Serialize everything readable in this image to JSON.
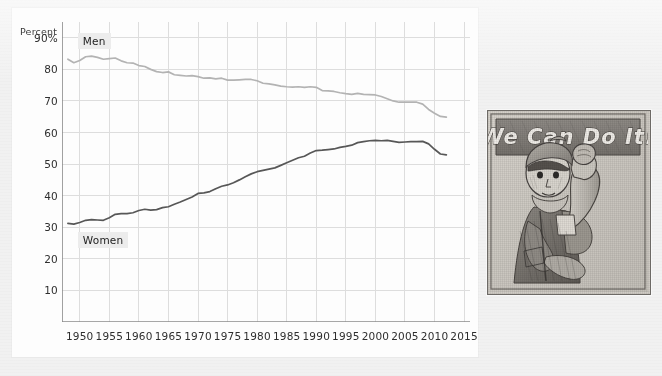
{
  "chart_data": {
    "type": "line",
    "title": "",
    "xlabel": "",
    "ylabel": "Percent",
    "ylim": [
      0,
      95
    ],
    "xlim": [
      1947,
      2016
    ],
    "grid": true,
    "legend": "inline-labels",
    "y_ticks": [
      "90%",
      "80",
      "70",
      "60",
      "50",
      "40",
      "30",
      "20",
      "10"
    ],
    "y_tick_values": [
      90,
      80,
      70,
      60,
      50,
      40,
      30,
      20,
      10
    ],
    "x_ticks": [
      "1950",
      "1955",
      "1960",
      "1965",
      "1970",
      "1975",
      "1980",
      "1985",
      "1990",
      "1995",
      "2000",
      "2005",
      "2010",
      "2015"
    ],
    "x_tick_values": [
      1950,
      1955,
      1960,
      1965,
      1970,
      1975,
      1980,
      1985,
      1990,
      1995,
      2000,
      2005,
      2010,
      2015
    ],
    "x": [
      1948,
      1949,
      1950,
      1951,
      1952,
      1953,
      1954,
      1955,
      1956,
      1957,
      1958,
      1959,
      1960,
      1961,
      1962,
      1963,
      1964,
      1965,
      1966,
      1967,
      1968,
      1969,
      1970,
      1971,
      1972,
      1973,
      1974,
      1975,
      1976,
      1977,
      1978,
      1979,
      1980,
      1981,
      1982,
      1983,
      1984,
      1985,
      1986,
      1987,
      1988,
      1989,
      1990,
      1991,
      1992,
      1993,
      1994,
      1995,
      1996,
      1997,
      1998,
      1999,
      2000,
      2001,
      2002,
      2003,
      2004,
      2005,
      2006,
      2007,
      2008,
      2009,
      2010,
      2011,
      2012
    ],
    "series": [
      {
        "name": "Men",
        "color": "#b3b3b3",
        "values": [
          83.2,
          82.1,
          82.8,
          84.0,
          84.2,
          83.8,
          83.2,
          83.4,
          83.6,
          82.7,
          82.1,
          82.0,
          81.2,
          80.9,
          80.0,
          79.3,
          79.0,
          79.2,
          78.3,
          78.1,
          77.9,
          78.0,
          77.7,
          77.2,
          77.3,
          77.0,
          77.2,
          76.6,
          76.6,
          76.7,
          76.8,
          76.8,
          76.4,
          75.6,
          75.4,
          75.1,
          74.7,
          74.5,
          74.4,
          74.5,
          74.3,
          74.5,
          74.3,
          73.3,
          73.2,
          73.0,
          72.6,
          72.3,
          72.1,
          72.4,
          72.1,
          72.0,
          71.9,
          71.4,
          70.7,
          70.0,
          69.6,
          69.6,
          69.6,
          69.6,
          69.0,
          67.3,
          66.1,
          65.1,
          64.9
        ]
      },
      {
        "name": "Women",
        "color": "#575757",
        "values": [
          31.2,
          31.0,
          31.5,
          32.2,
          32.4,
          32.3,
          32.2,
          33.0,
          34.1,
          34.3,
          34.3,
          34.6,
          35.3,
          35.7,
          35.4,
          35.6,
          36.2,
          36.5,
          37.3,
          38.0,
          38.8,
          39.6,
          40.7,
          40.9,
          41.3,
          42.2,
          43.0,
          43.4,
          44.1,
          45.0,
          46.0,
          46.9,
          47.6,
          48.0,
          48.4,
          48.8,
          49.6,
          50.4,
          51.2,
          52.0,
          52.5,
          53.5,
          54.3,
          54.4,
          54.6,
          54.8,
          55.3,
          55.6,
          56.0,
          56.8,
          57.1,
          57.4,
          57.5,
          57.4,
          57.5,
          57.2,
          56.9,
          57.0,
          57.1,
          57.1,
          57.2,
          56.4,
          54.7,
          53.2,
          52.9
        ]
      }
    ],
    "annotations": [
      {
        "text": "Men",
        "x": 1949,
        "y": 89
      },
      {
        "text": "Women",
        "x": 1949,
        "y": 26
      }
    ]
  },
  "illustration": {
    "name": "rosie-the-riveter-sketch",
    "speech_bubble_text": "We Can Do It!",
    "style": "hand-drawn pencil sketch",
    "frame_color": "#6d6a66",
    "paper_color": "#cfcbc4"
  }
}
